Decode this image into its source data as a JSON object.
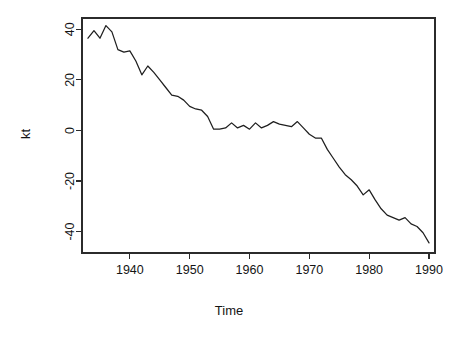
{
  "chart_data": {
    "type": "line",
    "title": "",
    "xlabel": "Time",
    "ylabel": "kt",
    "xlim": [
      1932.0,
      1991.0
    ],
    "ylim": [
      -48.5,
      44.5
    ],
    "xticks": [
      1940,
      1950,
      1960,
      1970,
      1980,
      1990
    ],
    "yticks": [
      40,
      20,
      0,
      -20,
      -40
    ],
    "xtick_labels": [
      "1940",
      "1950",
      "1960",
      "1970",
      "1980",
      "1990"
    ],
    "ytick_labels": [
      "40",
      "20",
      "0",
      "-20",
      "-40"
    ],
    "grid": false,
    "legend": false,
    "line_color": "#1f1f1f",
    "series": [
      {
        "name": "kt",
        "x": [
          1933,
          1934,
          1935,
          1936,
          1937,
          1938,
          1939,
          1940,
          1941,
          1942,
          1943,
          1944,
          1945,
          1946,
          1947,
          1948,
          1949,
          1950,
          1951,
          1952,
          1953,
          1954,
          1955,
          1956,
          1957,
          1958,
          1959,
          1960,
          1961,
          1962,
          1963,
          1964,
          1965,
          1966,
          1967,
          1968,
          1969,
          1970,
          1971,
          1972,
          1973,
          1974,
          1975,
          1976,
          1977,
          1978,
          1979,
          1980,
          1981,
          1982,
          1983,
          1984,
          1985,
          1986,
          1987,
          1988,
          1989,
          1990
        ],
        "y": [
          36.5,
          39.5,
          36.5,
          41.5,
          39.0,
          32.0,
          31.0,
          31.5,
          27.5,
          22.0,
          25.5,
          23.0,
          20.0,
          17.0,
          14.0,
          13.5,
          12.0,
          9.5,
          8.5,
          8.0,
          5.5,
          0.5,
          0.5,
          1.0,
          3.0,
          1.0,
          2.0,
          0.5,
          3.0,
          1.0,
          2.0,
          3.5,
          2.5,
          2.0,
          1.5,
          3.5,
          1.0,
          -1.5,
          -3.0,
          -3.0,
          -7.5,
          -11.0,
          -14.5,
          -17.5,
          -19.5,
          -22.0,
          -25.5,
          -23.5,
          -27.5,
          -31.0,
          -33.5,
          -34.5,
          -35.5,
          -34.5,
          -37.0,
          -38.0,
          -40.5,
          -44.5
        ]
      }
    ]
  },
  "axis": {
    "x_title": "Time",
    "y_title": "kt"
  }
}
